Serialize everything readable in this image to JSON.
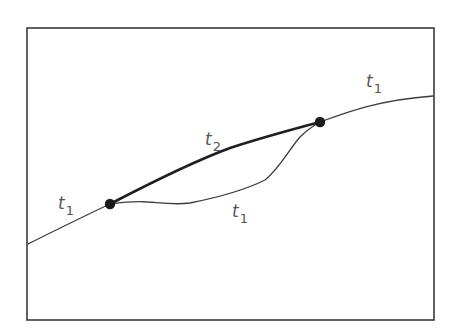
{
  "diagram": {
    "colors": {
      "background": "#ffffff",
      "frame": "#3a3a3a",
      "thin_line": "#3c3c3c",
      "thick_line": "#1f1f1f",
      "node": "#1a1a1a",
      "label": "#555555"
    },
    "nodes": [
      {
        "id": "left-node",
        "x": 110,
        "y": 204
      },
      {
        "id": "right-node",
        "x": 320,
        "y": 122
      }
    ],
    "labels": {
      "left_segment": {
        "var": "t",
        "sub": "1"
      },
      "right_segment": {
        "var": "t",
        "sub": "1"
      },
      "shortcut": {
        "var": "t",
        "sub": "2"
      },
      "detour": {
        "var": "t",
        "sub": "1"
      }
    }
  }
}
